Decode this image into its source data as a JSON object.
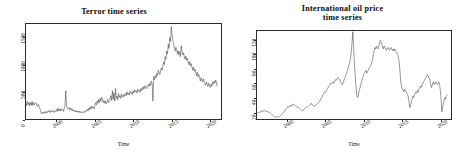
{
  "figure": {
    "background": "#ffffff",
    "line_color": "#1a1a1a",
    "panels": 2
  },
  "chart_data": [
    {
      "type": "line",
      "title": "Terror time series",
      "title_lines": [
        "Terror time series"
      ],
      "xlabel": "Time",
      "ylabel": "",
      "xlim": [
        1996.0,
        2021.5
      ],
      "ylim": [
        0,
        1750
      ],
      "xticks": [
        2000,
        2005,
        2010,
        2015,
        2020
      ],
      "xtick_labels": [
        "2000",
        "2005",
        "2010",
        "2015",
        "2020"
      ],
      "yticks": [
        0,
        500,
        1000,
        1500
      ],
      "ytick_labels": [
        "0",
        "500",
        "1000",
        "1500"
      ],
      "grid": false,
      "legend": "none",
      "x": [
        1996.0,
        1996.1,
        1996.2,
        1996.3,
        1996.4,
        1996.5,
        1996.6,
        1996.7,
        1996.8,
        1996.9,
        1997.0,
        1997.1,
        1997.2,
        1997.3,
        1997.4,
        1997.5,
        1997.6,
        1997.7,
        1997.8,
        1997.9,
        1998.0,
        1998.1,
        1998.2,
        1998.3,
        1998.4,
        1998.5,
        1998.6,
        1998.7,
        1998.8,
        1998.9,
        1999.0,
        1999.1,
        1999.2,
        1999.3,
        1999.4,
        1999.5,
        1999.6,
        1999.7,
        1999.8,
        1999.9,
        2000.0,
        2000.1,
        2000.2,
        2000.3,
        2000.4,
        2000.5,
        2000.6,
        2000.7,
        2000.8,
        2000.9,
        2001.0,
        2001.1,
        2001.2,
        2001.3,
        2001.4,
        2001.5,
        2001.6,
        2001.7,
        2001.8,
        2001.9,
        2002.0,
        2002.1,
        2002.2,
        2002.3,
        2002.4,
        2002.5,
        2002.6,
        2002.7,
        2002.8,
        2002.9,
        2003.0,
        2003.1,
        2003.2,
        2003.3,
        2003.4,
        2003.5,
        2003.6,
        2003.7,
        2003.8,
        2003.9,
        2004.0,
        2004.1,
        2004.2,
        2004.3,
        2004.4,
        2004.5,
        2004.6,
        2004.7,
        2004.8,
        2004.9,
        2005.0,
        2005.1,
        2005.2,
        2005.3,
        2005.4,
        2005.5,
        2005.6,
        2005.7,
        2005.8,
        2005.9,
        2006.0,
        2006.1,
        2006.2,
        2006.3,
        2006.4,
        2006.5,
        2006.6,
        2006.7,
        2006.8,
        2006.9,
        2007.0,
        2007.1,
        2007.2,
        2007.3,
        2007.4,
        2007.5,
        2007.6,
        2007.7,
        2007.8,
        2007.9,
        2008.0,
        2008.1,
        2008.2,
        2008.3,
        2008.4,
        2008.5,
        2008.6,
        2008.7,
        2008.8,
        2008.9,
        2009.0,
        2009.1,
        2009.2,
        2009.3,
        2009.4,
        2009.5,
        2009.6,
        2009.7,
        2009.8,
        2009.9,
        2010.0,
        2010.1,
        2010.2,
        2010.3,
        2010.4,
        2010.5,
        2010.6,
        2010.7,
        2010.8,
        2010.9,
        2011.0,
        2011.1,
        2011.2,
        2011.3,
        2011.4,
        2011.5,
        2011.6,
        2011.7,
        2011.8,
        2011.9,
        2012.0,
        2012.1,
        2012.2,
        2012.3,
        2012.4,
        2012.5,
        2012.6,
        2012.7,
        2012.8,
        2012.9,
        2013.0,
        2013.1,
        2013.2,
        2013.3,
        2013.4,
        2013.5,
        2013.6,
        2013.7,
        2013.8,
        2013.9,
        2014.0,
        2014.1,
        2014.2,
        2014.3,
        2014.4,
        2014.5,
        2014.6,
        2014.7,
        2014.8,
        2014.9,
        2015.0,
        2015.1,
        2015.2,
        2015.3,
        2015.4,
        2015.5,
        2015.6,
        2015.7,
        2015.8,
        2015.9,
        2016.0,
        2016.1,
        2016.2,
        2016.3,
        2016.4,
        2016.5,
        2016.6,
        2016.7,
        2016.8,
        2016.9,
        2017.0,
        2017.1,
        2017.2,
        2017.3,
        2017.4,
        2017.5,
        2017.6,
        2017.7,
        2017.8,
        2017.9,
        2018.0,
        2018.1,
        2018.2,
        2018.3,
        2018.4,
        2018.5,
        2018.6,
        2018.7,
        2018.8,
        2018.9,
        2019.0,
        2019.1,
        2019.2,
        2019.3,
        2019.4,
        2019.5,
        2019.6,
        2019.7,
        2019.8,
        2019.9,
        2020.0,
        2020.1,
        2020.2,
        2020.3,
        2020.4,
        2020.5,
        2020.6,
        2020.7,
        2020.8,
        2020.9,
        2021.0
      ],
      "values": [
        300,
        250,
        330,
        265,
        300,
        240,
        310,
        255,
        320,
        250,
        300,
        260,
        290,
        300,
        250,
        230,
        270,
        240,
        200,
        150,
        100,
        120,
        95,
        130,
        110,
        140,
        105,
        135,
        120,
        150,
        130,
        160,
        120,
        145,
        130,
        165,
        140,
        120,
        150,
        135,
        175,
        140,
        200,
        150,
        185,
        145,
        190,
        160,
        175,
        140,
        200,
        250,
        520,
        230,
        200,
        185,
        215,
        175,
        200,
        160,
        190,
        150,
        170,
        140,
        160,
        130,
        155,
        125,
        150,
        120,
        145,
        115,
        140,
        120,
        135,
        110,
        130,
        150,
        125,
        160,
        180,
        145,
        200,
        170,
        220,
        185,
        240,
        200,
        215,
        185,
        250,
        300,
        260,
        330,
        290,
        360,
        300,
        380,
        330,
        400,
        350,
        300,
        340,
        290,
        330,
        280,
        320,
        360,
        300,
        340,
        380,
        430,
        340,
        520,
        360,
        480,
        330,
        560,
        380,
        420,
        350,
        470,
        400,
        430,
        380,
        460,
        420,
        400,
        450,
        420,
        470,
        430,
        500,
        450,
        480,
        440,
        510,
        470,
        490,
        450,
        520,
        480,
        540,
        500,
        520,
        480,
        550,
        510,
        530,
        490,
        560,
        520,
        580,
        540,
        600,
        560,
        620,
        580,
        560,
        600,
        640,
        600,
        660,
        620,
        700,
        650,
        330,
        780,
        720,
        800,
        760,
        840,
        800,
        900,
        860,
        820,
        880,
        940,
        900,
        980,
        1050,
        1000,
        1150,
        1100,
        1250,
        1200,
        1380,
        1300,
        1500,
        1430,
        1700,
        1560,
        1450,
        1380,
        1300,
        1250,
        1320,
        1270,
        1200,
        1260,
        1180,
        1240,
        1150,
        1350,
        1250,
        1180,
        1220,
        1150,
        1100,
        1160,
        1080,
        1120,
        1050,
        1000,
        1060,
        980,
        1020,
        950,
        900,
        960,
        880,
        920,
        850,
        800,
        860,
        780,
        820,
        750,
        700,
        760,
        720,
        680,
        740,
        700,
        660,
        620,
        680,
        640,
        600,
        660,
        620,
        580,
        640,
        600,
        680,
        640,
        700,
        660,
        720,
        680,
        600
      ]
    },
    {
      "type": "line",
      "title": "International oil price time series",
      "title_lines": [
        "International oil price",
        "time series"
      ],
      "xlabel": "Time",
      "ylabel": "",
      "xlim": [
        1996.0,
        2021.5
      ],
      "ylim": [
        10,
        133
      ],
      "xticks": [
        2000,
        2005,
        2010,
        2015,
        2020
      ],
      "xtick_labels": [
        "2000",
        "2005",
        "2010",
        "2015",
        "2020"
      ],
      "yticks": [
        20,
        40,
        60,
        80,
        100,
        120
      ],
      "ytick_labels": [
        "20",
        "40",
        "60",
        "80",
        "100",
        "120"
      ],
      "grid": false,
      "legend": "none",
      "x": [
        1996.0,
        1996.1,
        1996.2,
        1996.3,
        1996.4,
        1996.5,
        1996.6,
        1996.7,
        1996.8,
        1996.9,
        1997.0,
        1997.1,
        1997.2,
        1997.3,
        1997.4,
        1997.5,
        1997.6,
        1997.7,
        1997.8,
        1997.9,
        1998.0,
        1998.1,
        1998.2,
        1998.3,
        1998.4,
        1998.5,
        1998.6,
        1998.7,
        1998.8,
        1998.9,
        1999.0,
        1999.1,
        1999.2,
        1999.3,
        1999.4,
        1999.5,
        1999.6,
        1999.7,
        1999.8,
        1999.9,
        2000.0,
        2000.1,
        2000.2,
        2000.3,
        2000.4,
        2000.5,
        2000.6,
        2000.7,
        2000.8,
        2000.9,
        2001.0,
        2001.1,
        2001.2,
        2001.3,
        2001.4,
        2001.5,
        2001.6,
        2001.7,
        2001.8,
        2001.9,
        2002.0,
        2002.1,
        2002.2,
        2002.3,
        2002.4,
        2002.5,
        2002.6,
        2002.7,
        2002.8,
        2002.9,
        2003.0,
        2003.1,
        2003.2,
        2003.3,
        2003.4,
        2003.5,
        2003.6,
        2003.7,
        2003.8,
        2003.9,
        2004.0,
        2004.1,
        2004.2,
        2004.3,
        2004.4,
        2004.5,
        2004.6,
        2004.7,
        2004.8,
        2004.9,
        2005.0,
        2005.1,
        2005.2,
        2005.3,
        2005.4,
        2005.5,
        2005.6,
        2005.7,
        2005.8,
        2005.9,
        2006.0,
        2006.1,
        2006.2,
        2006.3,
        2006.4,
        2006.5,
        2006.6,
        2006.7,
        2006.8,
        2006.9,
        2007.0,
        2007.1,
        2007.2,
        2007.3,
        2007.4,
        2007.5,
        2007.6,
        2007.7,
        2007.8,
        2007.9,
        2008.0,
        2008.1,
        2008.2,
        2008.3,
        2008.4,
        2008.5,
        2008.6,
        2008.7,
        2008.8,
        2008.9,
        2009.0,
        2009.1,
        2009.2,
        2009.3,
        2009.4,
        2009.5,
        2009.6,
        2009.7,
        2009.8,
        2009.9,
        2010.0,
        2010.1,
        2010.2,
        2010.3,
        2010.4,
        2010.5,
        2010.6,
        2010.7,
        2010.8,
        2010.9,
        2011.0,
        2011.1,
        2011.2,
        2011.3,
        2011.4,
        2011.5,
        2011.6,
        2011.7,
        2011.8,
        2011.9,
        2012.0,
        2012.1,
        2012.2,
        2012.3,
        2012.4,
        2012.5,
        2012.6,
        2012.7,
        2012.8,
        2012.9,
        2013.0,
        2013.1,
        2013.2,
        2013.3,
        2013.4,
        2013.5,
        2013.6,
        2013.7,
        2013.8,
        2013.9,
        2014.0,
        2014.1,
        2014.2,
        2014.3,
        2014.4,
        2014.5,
        2014.6,
        2014.7,
        2014.8,
        2014.9,
        2015.0,
        2015.1,
        2015.2,
        2015.3,
        2015.4,
        2015.5,
        2015.6,
        2015.7,
        2015.8,
        2015.9,
        2016.0,
        2016.1,
        2016.2,
        2016.3,
        2016.4,
        2016.5,
        2016.6,
        2016.7,
        2016.8,
        2016.9,
        2017.0,
        2017.1,
        2017.2,
        2017.3,
        2017.4,
        2017.5,
        2017.6,
        2017.7,
        2017.8,
        2017.9,
        2018.0,
        2018.1,
        2018.2,
        2018.3,
        2018.4,
        2018.5,
        2018.6,
        2018.7,
        2018.8,
        2018.9,
        2019.0,
        2019.1,
        2019.2,
        2019.3,
        2019.4,
        2019.5,
        2019.6,
        2019.7,
        2019.8,
        2019.9,
        2020.0,
        2020.1,
        2020.2,
        2020.3,
        2020.4,
        2020.5,
        2020.6,
        2020.7,
        2020.8,
        2020.9,
        2021.0
      ],
      "values": [
        18,
        18.5,
        19,
        20,
        19,
        20.5,
        21,
        20,
        22,
        21,
        22,
        21,
        20,
        21.5,
        20,
        19,
        20,
        19,
        18,
        17,
        16,
        15,
        14,
        13,
        13.5,
        13,
        12.5,
        13,
        12,
        13,
        14,
        15,
        16,
        17,
        18,
        19,
        21,
        22,
        24,
        25,
        27,
        26,
        28,
        27,
        29,
        28,
        30,
        29,
        31,
        30,
        29,
        28,
        27,
        26,
        27,
        26,
        25,
        24,
        23,
        22,
        21,
        22,
        24,
        25,
        26,
        27,
        26,
        27,
        28,
        29,
        30,
        32,
        31,
        29,
        28,
        29,
        28,
        29,
        30,
        31,
        32,
        33,
        34,
        36,
        38,
        40,
        42,
        44,
        46,
        48,
        47,
        49,
        51,
        53,
        55,
        57,
        58,
        60,
        59,
        61,
        62,
        60,
        63,
        65,
        64,
        66,
        68,
        67,
        66,
        64,
        62,
        60,
        58,
        60,
        63,
        66,
        69,
        72,
        75,
        78,
        82,
        86,
        90,
        96,
        104,
        118,
        132,
        110,
        88,
        72,
        58,
        44,
        40,
        42,
        48,
        52,
        56,
        60,
        64,
        68,
        72,
        74,
        76,
        78,
        74,
        76,
        78,
        80,
        82,
        84,
        86,
        90,
        94,
        100,
        106,
        110,
        108,
        112,
        110,
        108,
        112,
        116,
        120,
        118,
        114,
        110,
        108,
        112,
        110,
        108,
        106,
        108,
        110,
        108,
        106,
        108,
        110,
        108,
        106,
        108,
        105,
        108,
        106,
        104,
        102,
        100,
        96,
        88,
        76,
        62,
        55,
        52,
        50,
        48,
        52,
        50,
        48,
        46,
        44,
        40,
        32,
        26,
        30,
        34,
        38,
        42,
        40,
        44,
        46,
        48,
        46,
        50,
        48,
        52,
        54,
        56,
        54,
        58,
        60,
        62,
        64,
        66,
        68,
        70,
        72,
        70,
        68,
        66,
        60,
        54,
        56,
        60,
        62,
        58,
        60,
        62,
        60,
        58,
        60,
        62,
        58,
        50,
        36,
        20,
        26,
        32,
        36,
        40,
        38,
        42,
        44
      ]
    }
  ]
}
